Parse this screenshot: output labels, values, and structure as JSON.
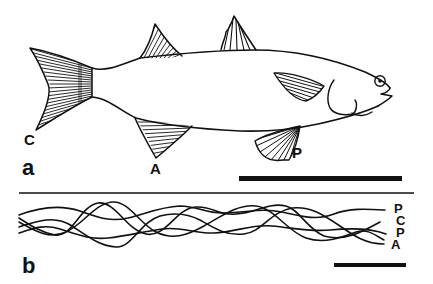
{
  "figure": {
    "type": "scientific-illustration",
    "panels": [
      {
        "id": "a",
        "label": "a",
        "description": "Line drawing of a fish (lateral view) with labelled fins",
        "fin_labels": {
          "caudal": "C",
          "anal": "A",
          "pectoral": "P"
        },
        "scale_bar": true
      },
      {
        "id": "b",
        "label": "b",
        "description": "Superimposed sinusoidal traces of fin movements",
        "trace_labels": [
          "P",
          "C",
          "P",
          "A"
        ],
        "scale_bar": true
      }
    ],
    "colors": {
      "ink": "#111111",
      "background": "#ffffff"
    }
  }
}
